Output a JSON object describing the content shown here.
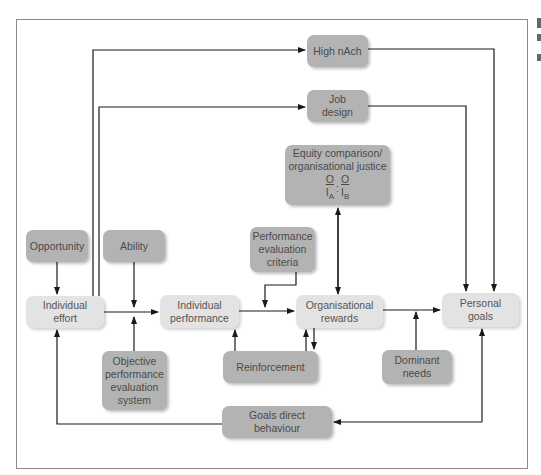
{
  "diagram": {
    "nodes": {
      "high_nach": {
        "label": "High nAch"
      },
      "job_design": {
        "label_lines": [
          "Job",
          "design"
        ]
      },
      "equity": {
        "label_lines": [
          "Equity comparison/",
          "organisational justice"
        ],
        "ratio": {
          "left_num": "O",
          "left_den": "I",
          "left_sub": "A",
          "sep": ":",
          "right_num": "O",
          "right_den": "I",
          "right_sub": "B"
        }
      },
      "opportunity": {
        "label": "Opportunity"
      },
      "ability": {
        "label": "Ability"
      },
      "individual_effort": {
        "label_lines": [
          "Individual",
          "effort"
        ]
      },
      "individual_performance": {
        "label_lines": [
          "Individual",
          "performance"
        ]
      },
      "performance_evaluation_criteria": {
        "label_lines": [
          "Performance",
          "evaluation",
          "criteria"
        ]
      },
      "organisational_rewards": {
        "label_lines": [
          "Organisational",
          "rewards"
        ]
      },
      "personal_goals": {
        "label_lines": [
          "Personal",
          "goals"
        ]
      },
      "objective_performance_evaluation_system": {
        "label_lines": [
          "Objective",
          "performance",
          "evaluation",
          "system"
        ]
      },
      "reinforcement": {
        "label": "Reinforcement"
      },
      "dominant_needs": {
        "label_lines": [
          "Dominant",
          "needs"
        ]
      },
      "goals_direct_behaviour": {
        "label": "Goals direct behaviour"
      }
    },
    "edges": [
      {
        "from": "Individual effort",
        "to": "High nAch"
      },
      {
        "from": "Individual effort",
        "to": "Job design"
      },
      {
        "from": "High nAch",
        "to": "Personal goals"
      },
      {
        "from": "Job design",
        "to": "Personal goals"
      },
      {
        "from": "Opportunity",
        "to": "Individual effort"
      },
      {
        "from": "Ability",
        "to": "Individual effort → Individual performance link"
      },
      {
        "from": "Objective performance evaluation system",
        "to": "Individual effort → Individual performance link"
      },
      {
        "from": "Individual effort",
        "to": "Individual performance"
      },
      {
        "from": "Individual performance",
        "to": "Organisational rewards"
      },
      {
        "from": "Performance evaluation criteria",
        "to": "Individual performance → Organisational rewards link"
      },
      {
        "from": "Organisational rewards",
        "to": "Equity comparison/organisational justice",
        "bidirectional": true
      },
      {
        "from": "Organisational rewards",
        "to": "Reinforcement",
        "bidirectional": true
      },
      {
        "from": "Reinforcement",
        "to": "Individual performance"
      },
      {
        "from": "Organisational rewards",
        "to": "Personal goals"
      },
      {
        "from": "Dominant needs",
        "to": "Organisational rewards → Personal goals link"
      },
      {
        "from": "Personal goals",
        "to": "Goals direct behaviour",
        "bidirectional": true
      },
      {
        "from": "Goals direct behaviour",
        "to": "Individual effort"
      }
    ],
    "colors": {
      "dark_box": "#b3b3b3",
      "light_box": "#e3e3e3",
      "line": "#1a1a1a",
      "frame": "#8a8a8a"
    }
  }
}
